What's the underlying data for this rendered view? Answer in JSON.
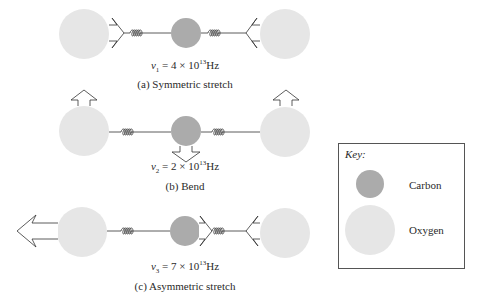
{
  "colors": {
    "carbon": "#ababab",
    "oxygen": "#e6e6e6",
    "line": "#333333"
  },
  "modes": [
    {
      "id": "a",
      "caption": "(a) Symmetric stretch",
      "freq": {
        "symbol": "v",
        "subscript": "1",
        "equals": " = 4 × 10",
        "exponent": "13",
        "unit": "Hz"
      }
    },
    {
      "id": "b",
      "caption": "(b) Bend",
      "freq": {
        "symbol": "v",
        "subscript": "2",
        "equals": " = 2 × 10",
        "exponent": "13",
        "unit": "Hz"
      }
    },
    {
      "id": "c",
      "caption": "(c) Asymmetric stretch",
      "freq": {
        "symbol": "v",
        "subscript": "3",
        "equals": " = 7 × 10",
        "exponent": "13",
        "unit": "Hz"
      }
    }
  ],
  "key": {
    "title": "Key:",
    "items": [
      {
        "label": "Carbon",
        "icon": "carbon-atom-circle"
      },
      {
        "label": "Oxygen",
        "icon": "oxygen-atom-circle"
      }
    ]
  }
}
